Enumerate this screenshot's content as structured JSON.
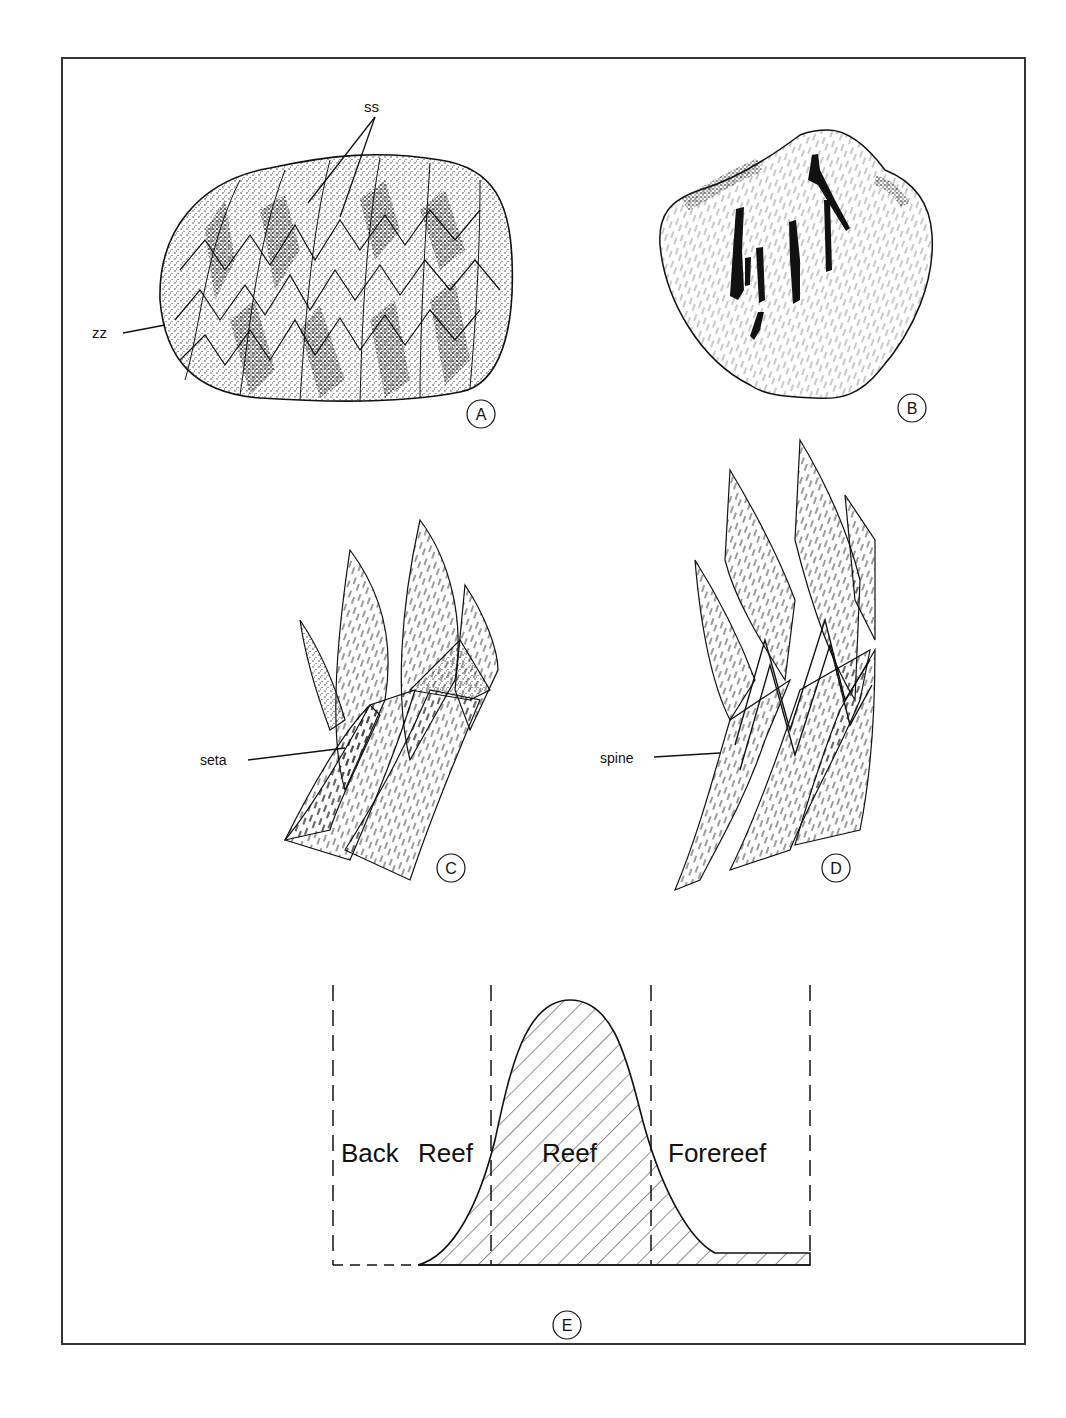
{
  "figure": {
    "panels": [
      {
        "id": "A",
        "label": "A",
        "annotations": [
          "ss",
          "zz"
        ],
        "subject": "shell with zigzag commissure and sutures"
      },
      {
        "id": "B",
        "label": "B",
        "annotations": [],
        "subject": "brachiopod valve with dark markings"
      },
      {
        "id": "C",
        "label": "C",
        "annotations": [
          "seta"
        ],
        "subject": "interlocking shell margins with seta"
      },
      {
        "id": "D",
        "label": "D",
        "annotations": [
          "spine"
        ],
        "subject": "interlocking shell margins with spine"
      },
      {
        "id": "E",
        "label": "E",
        "annotations": [],
        "subject": "abundance across reef environments"
      }
    ],
    "labels": {
      "ss": "ss",
      "zz": "zz",
      "seta": "seta",
      "spine": "spine"
    },
    "reef_profile": {
      "zones": [
        "Back Reef",
        "Reef",
        "Forereef"
      ],
      "zone_back_1": "Back",
      "zone_back_2": "Reef",
      "zone_reef": "Reef",
      "zone_fore": "Forereef"
    },
    "colors": {
      "ink": "#111111",
      "frame": "#333333",
      "background": "#ffffff"
    }
  }
}
